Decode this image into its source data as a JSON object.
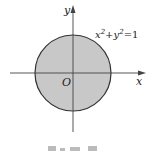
{
  "figure": {
    "axes": {
      "x_label": "x",
      "y_label": "y",
      "origin_label": "O"
    },
    "circle": {
      "equation_base_x": "x",
      "equation_base_y": "y",
      "exp": "2",
      "plus": "+",
      "equals": "=1",
      "fill": "#c8c8c8",
      "stroke": "#333333"
    }
  }
}
